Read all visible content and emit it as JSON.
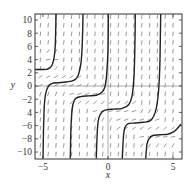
{
  "chart_data": {
    "type": "line",
    "title": "",
    "subtitle": "Direction field with solution curves",
    "xlabel": "x",
    "ylabel": "y",
    "xlim": [
      -5.6,
      5.6
    ],
    "ylim": [
      -11,
      10.9
    ],
    "xticks": [
      -5,
      0,
      5
    ],
    "xtick_labels": [
      "−5",
      "0",
      "5"
    ],
    "yticks": [
      10,
      8,
      6,
      4,
      2,
      0,
      -2,
      -4,
      -6,
      -8,
      -10
    ],
    "ytick_labels": [
      "10",
      "8",
      "6",
      "4",
      "2",
      "0",
      "−2",
      "4",
      "−6",
      "−8",
      "−10"
    ],
    "grid": false,
    "zero_lines": true,
    "legend": null,
    "colors": {
      "curve": "#222222",
      "field": "#555555",
      "frame": "#333333",
      "axis": "#888888"
    },
    "series": [
      {
        "name": "curve-1",
        "x": [
          -5.6,
          -5.0,
          -4.6,
          -4.35,
          -4.2,
          -4.1,
          -4.05,
          -4.02,
          -4.0
        ],
        "y": [
          2.5,
          2.5,
          2.6,
          3.0,
          3.8,
          5.0,
          6.5,
          8.5,
          10.9
        ]
      },
      {
        "name": "curve-2",
        "x": [
          -5.0,
          -4.95,
          -4.9,
          -4.8,
          -4.6,
          -4.3,
          -3.8,
          -3.2,
          -2.6,
          -2.3,
          -2.1,
          -2.0,
          -1.95,
          -1.92
        ],
        "y": [
          -11,
          -6,
          -3,
          -1.2,
          -0.1,
          0.4,
          0.5,
          0.6,
          0.9,
          1.6,
          3.2,
          5.5,
          8.5,
          10.9
        ]
      },
      {
        "name": "curve-3",
        "x": [
          -2.9,
          -2.85,
          -2.8,
          -2.7,
          -2.5,
          -2.1,
          -1.5,
          -0.9,
          -0.5,
          -0.25,
          -0.1,
          0.0,
          0.03
        ],
        "y": [
          -11,
          -6.5,
          -4.5,
          -2.8,
          -1.9,
          -1.6,
          -1.5,
          -1.4,
          -1.0,
          -0.2,
          1.8,
          5.5,
          10.9
        ]
      },
      {
        "name": "curve-4",
        "x": [
          -0.9,
          -0.85,
          -0.8,
          -0.7,
          -0.45,
          -0.1,
          0.4,
          1.1,
          1.6,
          1.85,
          2.0,
          2.07,
          2.1
        ],
        "y": [
          -11,
          -8,
          -6.2,
          -4.8,
          -3.9,
          -3.6,
          -3.5,
          -3.4,
          -2.8,
          -1.5,
          1.5,
          6.0,
          10.9
        ]
      },
      {
        "name": "curve-5",
        "x": [
          1.1,
          1.15,
          1.2,
          1.3,
          1.55,
          2.0,
          2.7,
          3.3,
          3.7,
          3.9,
          4.0,
          4.05
        ],
        "y": [
          -11,
          -8.8,
          -7.4,
          -6.3,
          -5.7,
          -5.6,
          -5.5,
          -5.2,
          -3.5,
          -0.5,
          4.0,
          10.9
        ]
      },
      {
        "name": "curve-6",
        "x": [
          2.9,
          2.95,
          3.0,
          3.15,
          3.45,
          4.0,
          4.6,
          5.0,
          5.3,
          5.6
        ],
        "y": [
          -11,
          -9.8,
          -8.8,
          -8.0,
          -7.5,
          -7.4,
          -7.3,
          -7.0,
          -6.5,
          -5.8
        ]
      }
    ],
    "field": {
      "x_step": 0.6,
      "y_step": 1.3,
      "x_start": -5.2,
      "y_start": -10.3,
      "segment_length_px": 4.5
    }
  }
}
